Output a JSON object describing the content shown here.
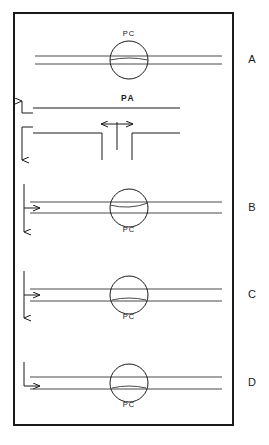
{
  "figure": {
    "title": "",
    "frame": {
      "x": 14,
      "y": 13,
      "width": 219,
      "height": 412
    },
    "panel_labels": [
      {
        "id": "A",
        "text": "A",
        "x": 252,
        "y": 63
      },
      {
        "id": "B",
        "text": "B",
        "x": 252,
        "y": 211
      },
      {
        "id": "C",
        "text": "C",
        "x": 252,
        "y": 298
      },
      {
        "id": "D",
        "text": "D",
        "x": 252,
        "y": 386
      }
    ],
    "component_labels": {
      "pc": "PC",
      "pa": "PA"
    },
    "panels": [
      {
        "id": "A",
        "label": "A",
        "pc_label": "PC",
        "pc_label_position": "above",
        "pc_label_x": 129,
        "pc_label_y": 36,
        "circle": {
          "cx": 129,
          "cy": 60,
          "r": 19
        },
        "pipe_top_y": 56,
        "pipe_bottom_y": 64,
        "pipe_x_start": 35,
        "pipe_x_end": 222,
        "inlet_arrow": "none"
      },
      {
        "id": "PA",
        "label": "PA",
        "pa_label_x": 128,
        "pa_label_y": 101,
        "upper_line_y": 108,
        "upper_line_x_start": 33,
        "upper_line_x_end": 180,
        "up_arrow_x": 22,
        "up_arrow_top_y": 101,
        "up_arrow_elbow_y": 113,
        "up_arrow_elbow_x": 33,
        "lower_line_y": 133,
        "lower_line_left_x_start": 33,
        "lower_line_left_x_end": 102,
        "lower_line_right_x_start": 132,
        "lower_line_right_x_end": 180,
        "down_arrow_x": 22,
        "down_arrow_top_y": 127,
        "down_arrow_bottom_y": 160,
        "down_arrow_elbow_x": 33,
        "gap_left_x": 102,
        "gap_right_x": 132,
        "gap_drop_y": 160,
        "stem_x": 117,
        "stem_top_y": 122,
        "stem_bottom_y": 150,
        "bidir_arrow_y": 124,
        "bidir_arrow_left_x": 101,
        "bidir_arrow_right_x": 133
      },
      {
        "id": "B",
        "label": "B",
        "pc_label": "PC",
        "pc_label_position": "below",
        "pc_label_x": 129,
        "pc_label_y": 232,
        "circle": {
          "cx": 129,
          "cy": 208,
          "r": 19
        },
        "pipe_top_y": 202,
        "pipe_bottom_y": 213,
        "pipe_x_start": 30,
        "pipe_x_end": 222,
        "inlet_arrow": "vertical-down-with-right-branch",
        "vline_x": 24,
        "vline_top_y": 184,
        "vline_bottom_y": 232,
        "branch_y": 208,
        "branch_x_end": 40
      },
      {
        "id": "C",
        "label": "C",
        "pc_label": "PC",
        "pc_label_position": "below",
        "pc_label_x": 129,
        "pc_label_y": 319,
        "circle": {
          "cx": 129,
          "cy": 295,
          "r": 19
        },
        "pipe_top_y": 289,
        "pipe_bottom_y": 301,
        "pipe_x_start": 30,
        "pipe_x_end": 222,
        "inlet_arrow": "vertical-down-with-right-branch",
        "vline_x": 24,
        "vline_top_y": 271,
        "vline_bottom_y": 318,
        "branch_y": 295,
        "branch_x_end": 40
      },
      {
        "id": "D",
        "label": "D",
        "pc_label": "PC",
        "pc_label_position": "below",
        "pc_label_x": 129,
        "pc_label_y": 407,
        "circle": {
          "cx": 129,
          "cy": 383,
          "r": 19
        },
        "pipe_top_y": 377,
        "pipe_bottom_y": 389,
        "pipe_x_start": 30,
        "pipe_x_end": 222,
        "inlet_arrow": "elbow-down-then-right",
        "elbow_x": 24,
        "elbow_top_y": 362,
        "elbow_corner_y": 386,
        "elbow_x_end": 40
      }
    ],
    "colors": {
      "ink": "#1a1a1a",
      "pipe": "#4a4a4a",
      "background": "#ffffff"
    }
  }
}
